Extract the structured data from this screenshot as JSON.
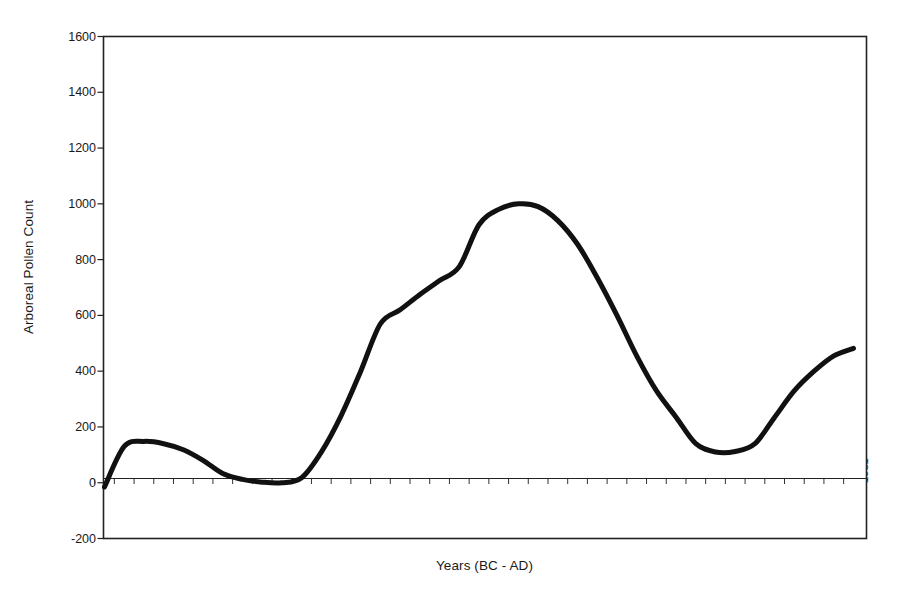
{
  "chart_data": {
    "type": "line",
    "title": "",
    "xlabel": "Years (BC - AD)",
    "ylabel": "Arboreal Pollen Count",
    "ylim": [
      -200,
      1600
    ],
    "y_ticks": [
      -200,
      0,
      200,
      400,
      600,
      800,
      1000,
      1200,
      1400,
      1600
    ],
    "y_tick_labels": [
      "-200",
      "0",
      "200",
      "400",
      "600",
      "800",
      "1000",
      "1200",
      "1400",
      "1600"
    ],
    "grid": false,
    "legend": "none",
    "line_color": "#111111",
    "line_width": 5,
    "categories": [
      "-4451",
      "-4210",
      "-3970",
      "-3729",
      "-3489",
      "-3249",
      "-3008",
      "-2888",
      "-2768",
      "-2647",
      "-2527",
      "-2287",
      "-2046",
      "-1806",
      "-1566",
      "-1505",
      "-1445",
      "-1385",
      "-1325",
      "-1085",
      "-964",
      "-844",
      "-724",
      "-604",
      "-484",
      "-363",
      "-243",
      "-123",
      "-3",
      "117",
      "358",
      "538",
      "719",
      "839",
      "1079",
      "1320",
      "1560",
      "1800",
      "1981"
    ],
    "values": [
      -15,
      130,
      148,
      140,
      118,
      80,
      33,
      12,
      2,
      0,
      18,
      110,
      240,
      400,
      570,
      620,
      675,
      725,
      775,
      925,
      980,
      1000,
      990,
      940,
      855,
      735,
      600,
      455,
      330,
      235,
      140,
      110,
      112,
      140,
      235,
      330,
      400,
      455,
      482
    ],
    "series_name": "Arboreal Pollen Count",
    "notes": {
      "peak_value": 1000,
      "peak_category": "-844",
      "first_local_peak_value": 148,
      "first_local_peak_category": "-3970",
      "global_min_value": 0,
      "global_min_category": "-2647",
      "second_trough_value": 110,
      "second_trough_category": "538",
      "end_value": 482,
      "end_category": "1981"
    }
  }
}
